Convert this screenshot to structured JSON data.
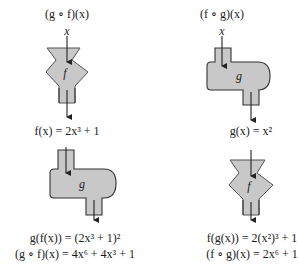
{
  "colors": {
    "fill": "#c8c8c8",
    "stroke": "#333333",
    "text": "#1a1a1a"
  },
  "left": {
    "title": "(g ∘ f)(x)",
    "input": "x",
    "machine1": {
      "type": "funnel",
      "label": "f"
    },
    "intermediate": "f(x) = 2x³ + 1",
    "machine2": {
      "type": "rounded-tank",
      "label": "g"
    },
    "result_line1": "g(f(x)) = (2x³ + 1)²",
    "result_line2": "(g ∘ f)(x) = 4x⁶ + 4x³ + 1"
  },
  "right": {
    "title": "(f ∘ g)(x)",
    "input": "x",
    "machine1": {
      "type": "rounded-tank",
      "label": "g"
    },
    "intermediate": "g(x) = x²",
    "machine2": {
      "type": "funnel",
      "label": "f"
    },
    "result_line1": "f(g(x)) = 2(x²)³ + 1",
    "result_line2": "(f ∘ g)(x) = 2x⁶ + 1"
  }
}
